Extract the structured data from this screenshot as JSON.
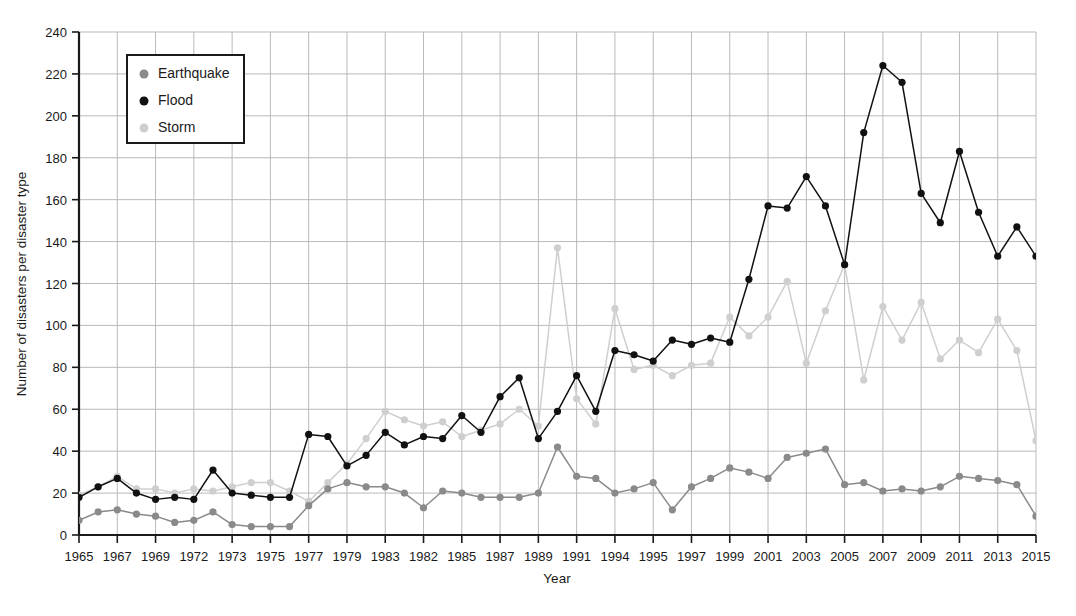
{
  "chart_data": {
    "type": "line",
    "title": "",
    "xlabel": "Year",
    "ylabel": "Number of disasters per disaster type",
    "ylim": [
      0,
      240
    ],
    "ytick_step": 20,
    "yticks": [
      0,
      20,
      40,
      60,
      80,
      100,
      120,
      140,
      160,
      180,
      200,
      220,
      240
    ],
    "grid": true,
    "grid_x": true,
    "grid_y": true,
    "legend_position": "top-left-inside",
    "x_start": 1965,
    "x_end": 2015,
    "x": [
      1965,
      1966,
      1967,
      1968,
      1969,
      1970,
      1972,
      1971,
      1973,
      1974,
      1975,
      1976,
      1977,
      1978,
      1979,
      1980,
      1983,
      1981,
      1982,
      1984,
      1985,
      1986,
      1987,
      1988,
      1989,
      1990,
      1991,
      1992,
      1994,
      1993,
      1995,
      1996,
      1997,
      1998,
      1999,
      2000,
      2001,
      2002,
      2003,
      2004,
      2005,
      2006,
      2007,
      2008,
      2009,
      2010,
      2011,
      2012,
      2013,
      2014,
      2015
    ],
    "xtick_labels": [
      "1965",
      "1967",
      "1969",
      "1972",
      "1973",
      "1975",
      "1977",
      "1979",
      "1983",
      "1982",
      "1985",
      "1987",
      "1989",
      "1991",
      "1994",
      "1995",
      "1997",
      "1999",
      "2001",
      "2003",
      "2005",
      "2007",
      "2009",
      "2011",
      "2013",
      "2015"
    ],
    "xtick_every": 2,
    "series": [
      {
        "name": "Earthquake",
        "color": "#8a8a8a",
        "marker": "circle",
        "values": [
          7,
          11,
          12,
          10,
          9,
          6,
          7,
          11,
          5,
          4,
          4,
          4,
          14,
          22,
          25,
          23,
          23,
          20,
          13,
          21,
          20,
          18,
          18,
          18,
          20,
          42,
          28,
          27,
          20,
          22,
          25,
          12,
          23,
          27,
          32,
          30,
          27,
          37,
          39,
          41,
          24,
          25,
          21,
          22,
          21,
          23,
          28,
          27,
          26,
          24,
          9
        ]
      },
      {
        "name": "Flood",
        "color": "#111111",
        "marker": "circle",
        "values": [
          18,
          23,
          27,
          20,
          17,
          18,
          17,
          31,
          20,
          19,
          18,
          18,
          48,
          47,
          33,
          38,
          49,
          43,
          47,
          46,
          57,
          49,
          66,
          75,
          46,
          59,
          76,
          59,
          88,
          86,
          83,
          93,
          91,
          94,
          92,
          122,
          157,
          156,
          171,
          157,
          129,
          192,
          224,
          216,
          163,
          149,
          183,
          154,
          133,
          147,
          133
        ]
      },
      {
        "name": "Storm",
        "color": "#cfcfcf",
        "marker": "circle",
        "values": [
          19,
          23,
          28,
          22,
          22,
          20,
          22,
          21,
          23,
          25,
          25,
          21,
          16,
          25,
          34,
          46,
          59,
          55,
          52,
          54,
          47,
          50,
          53,
          60,
          52,
          137,
          65,
          53,
          108,
          79,
          81,
          76,
          81,
          82,
          104,
          95,
          104,
          121,
          82,
          107,
          129,
          74,
          109,
          93,
          111,
          84,
          93,
          87,
          103,
          88,
          45
        ]
      }
    ]
  },
  "legend": {
    "items": [
      {
        "label": "Earthquake",
        "color": "#8a8a8a"
      },
      {
        "label": "Flood",
        "color": "#111111"
      },
      {
        "label": "Storm",
        "color": "#cfcfcf"
      }
    ]
  },
  "axes": {
    "x_axis_title": "Year",
    "y_axis_title": "Number of disasters per disaster type"
  },
  "style": {
    "axis_color": "#1a1a1a",
    "grid_color": "#b9b9b9",
    "background": "#ffffff"
  }
}
